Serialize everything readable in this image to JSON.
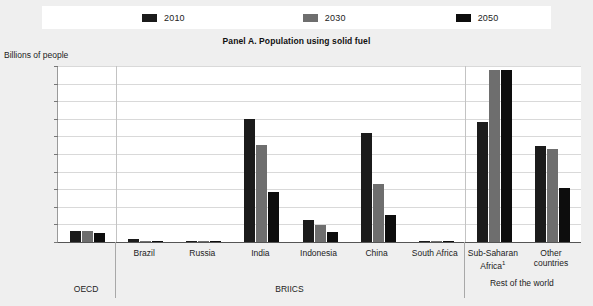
{
  "panel": {
    "title": "Panel A. Population using solid fuel",
    "y_axis_title": "Billions of people"
  },
  "legend": {
    "items": [
      {
        "label": "2010",
        "color": "#1b1b1b",
        "swatch_name": "legend-swatch-2010"
      },
      {
        "label": "2030",
        "color": "#6e6e6e",
        "swatch_name": "legend-swatch-2030"
      },
      {
        "label": "2050",
        "color": "#0d0d0d",
        "swatch_name": "legend-swatch-2050"
      }
    ]
  },
  "groups": [
    {
      "label": "OECD",
      "name": "group-oecd"
    },
    {
      "label": "BRIICS",
      "name": "group-briics"
    },
    {
      "label": "Rest of the world",
      "name": "group-rest-of-world"
    }
  ],
  "footnote_marker": "1",
  "chart_data": {
    "type": "bar",
    "title": "Panel A. Population using solid fuel",
    "xlabel": "",
    "ylabel": "Billions of people",
    "ylim": [
      0,
      1.0
    ],
    "ytick_labels": [
      "1.0",
      "0.9",
      "0.8",
      "0.7",
      "0.6",
      "0.5",
      "0.4",
      "0.3",
      "0.2",
      "0.1",
      "0"
    ],
    "ytick_values": [
      1.0,
      0.9,
      0.8,
      0.7,
      0.6,
      0.5,
      0.4,
      0.3,
      0.2,
      0.1,
      0
    ],
    "grid": true,
    "legend_position": "top",
    "categories": [
      "OECD",
      "Brazil",
      "Russia",
      "India",
      "Indonesia",
      "China",
      "South Africa",
      "Sub-Saharan Africa",
      "Other countries"
    ],
    "category_labels": [
      "OECD",
      "Brazil",
      "Russia",
      "India",
      "Indonesia",
      "China",
      "South Africa",
      "Sub-Saharan Africa¹",
      "Other countries"
    ],
    "category_groups": [
      "OECD",
      "BRIICS",
      "BRIICS",
      "BRIICS",
      "BRIICS",
      "BRIICS",
      "BRIICS",
      "Rest of the world",
      "Rest of the world"
    ],
    "series": [
      {
        "name": "2010",
        "color": "#1b1b1b",
        "values": [
          0.06,
          0.015,
          0.005,
          0.7,
          0.125,
          0.62,
          0.005,
          0.68,
          0.545
        ]
      },
      {
        "name": "2030",
        "color": "#6e6e6e",
        "values": [
          0.06,
          0.008,
          0.003,
          0.55,
          0.095,
          0.33,
          0.004,
          0.98,
          0.53
        ]
      },
      {
        "name": "2050",
        "color": "#0d0d0d",
        "values": [
          0.05,
          0.004,
          0.002,
          0.285,
          0.055,
          0.155,
          0.002,
          0.98,
          0.305
        ]
      }
    ]
  }
}
